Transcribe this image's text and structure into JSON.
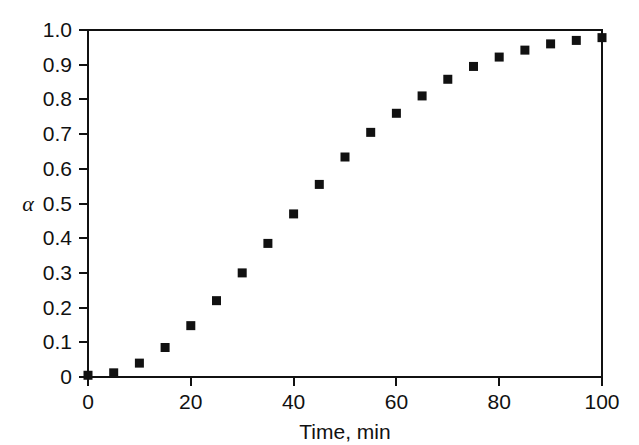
{
  "figure": {
    "background_color": "#ffffff",
    "foreground_color": "#111111",
    "width": 639,
    "height": 445
  },
  "axes": {
    "x_title": "Time, min",
    "y_title": "α",
    "x_tick_labels": [
      "0",
      "20",
      "40",
      "60",
      "80",
      "100"
    ],
    "y_tick_labels": [
      "0",
      "0.1",
      "0.2",
      "0.3",
      "0.4",
      "0.5",
      "0.6",
      "0.7",
      "0.8",
      "0.9",
      "1.0"
    ]
  },
  "chart_data": {
    "type": "scatter",
    "title": "",
    "subtitle": "",
    "xlabel": "Time, min",
    "ylabel": "α",
    "xlim": [
      0,
      100
    ],
    "ylim": [
      0,
      1.0
    ],
    "xticks": [
      0,
      20,
      40,
      60,
      80,
      100
    ],
    "yticks": [
      0,
      0.1,
      0.2,
      0.3,
      0.4,
      0.5,
      0.6,
      0.7,
      0.8,
      0.9,
      1.0
    ],
    "x_minor_tick_interval": 10,
    "y_minor_tick_interval": 0.1,
    "grid": false,
    "legend": null,
    "marker": {
      "shape": "square",
      "color": "#111111",
      "size_px": 9
    },
    "series": [
      {
        "name": "alpha vs time",
        "x": [
          0,
          5,
          10,
          15,
          20,
          25,
          30,
          35,
          40,
          45,
          50,
          55,
          60,
          65,
          70,
          75,
          80,
          85,
          90,
          95,
          100
        ],
        "y": [
          0.005,
          0.012,
          0.04,
          0.085,
          0.148,
          0.22,
          0.3,
          0.385,
          0.47,
          0.555,
          0.634,
          0.705,
          0.76,
          0.81,
          0.858,
          0.895,
          0.922,
          0.942,
          0.96,
          0.97,
          0.978
        ]
      }
    ],
    "annotations": []
  },
  "geometry": {
    "plot_left": 88,
    "plot_right": 602,
    "plot_top": 30,
    "plot_bottom": 377
  }
}
